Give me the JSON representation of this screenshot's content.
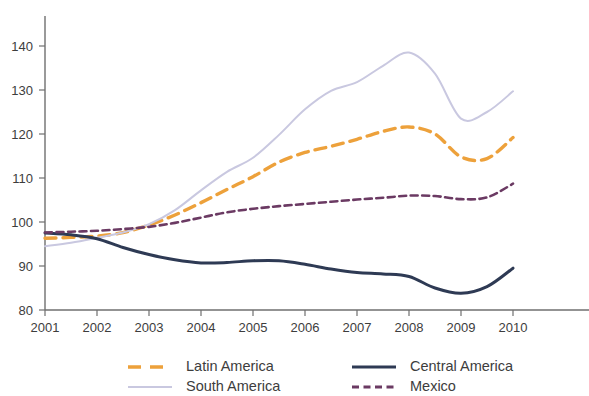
{
  "chart_data": {
    "type": "line",
    "title": "",
    "xlabel": "",
    "ylabel": "",
    "xlim": [
      2001,
      2010
    ],
    "ylim": [
      80,
      145
    ],
    "yticks": [
      80,
      90,
      100,
      110,
      120,
      130,
      140
    ],
    "ytick_labels": [
      "80",
      "90",
      "100",
      "110",
      "120",
      "130",
      "140"
    ],
    "xticks": [
      2001,
      2002,
      2003,
      2004,
      2005,
      2006,
      2007,
      2008,
      2009,
      2010
    ],
    "xtick_labels": [
      "2001",
      "2002",
      "2003",
      "2004",
      "2005",
      "2006",
      "2007",
      "2008",
      "2009",
      "2010"
    ],
    "grid": false,
    "legend_position": "bottom",
    "x": [
      2001,
      2001.5,
      2002,
      2002.5,
      2003,
      2003.5,
      2004,
      2004.5,
      2005,
      2005.5,
      2006,
      2006.5,
      2007,
      2007.5,
      2008,
      2008.5,
      2009,
      2009.5,
      2010
    ],
    "series": [
      {
        "name": "Latin America",
        "color": "#EDA13B",
        "style": "dashed",
        "values": [
          96.3,
          96.5,
          96.8,
          97.6,
          99.3,
          101.6,
          104.4,
          107.4,
          110.3,
          113.6,
          115.8,
          117.2,
          118.8,
          120.6,
          121.6,
          120.0,
          114.8,
          114.4,
          119.2
        ]
      },
      {
        "name": "South America",
        "color": "#C9C8E0",
        "style": "solid",
        "values": [
          94.5,
          95.3,
          96.4,
          97.6,
          99.5,
          102.7,
          107.2,
          111.4,
          114.6,
          119.8,
          125.6,
          129.8,
          131.8,
          135.5,
          138.5,
          133.7,
          123.5,
          125.0,
          129.7
        ]
      },
      {
        "name": "Central America",
        "color": "#2E3A54",
        "style": "solid",
        "values": [
          97.5,
          97.1,
          96.2,
          94.2,
          92.6,
          91.4,
          90.7,
          90.8,
          91.2,
          91.2,
          90.4,
          89.3,
          88.5,
          88.2,
          87.6,
          85.0,
          83.8,
          85.3,
          89.5
        ]
      },
      {
        "name": "Mexico",
        "color": "#6B3A63",
        "style": "dashed",
        "values": [
          97.6,
          97.8,
          98.0,
          98.4,
          98.9,
          99.8,
          101.0,
          102.2,
          103.0,
          103.6,
          104.1,
          104.6,
          105.1,
          105.5,
          106.0,
          105.9,
          105.2,
          105.6,
          108.7
        ]
      }
    ]
  },
  "legend": {
    "items": [
      {
        "label": "Latin America",
        "color": "#EDA13B",
        "style": "dashed"
      },
      {
        "label": "Central America",
        "color": "#2E3A54",
        "style": "solid"
      },
      {
        "label": "South America",
        "color": "#C9C8E0",
        "style": "solid"
      },
      {
        "label": "Mexico",
        "color": "#6B3A63",
        "style": "dashed"
      }
    ]
  }
}
